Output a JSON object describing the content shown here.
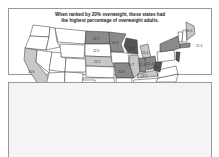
{
  "map": {
    "title_line1": "When ranked by 20% overweight, these states had",
    "title_line2": "the highest percentage of overweight adults.",
    "colors": {
      "dark": "#555555",
      "medium": "#8a8a8a",
      "light": "#c8c8c8",
      "none": "#ffffff",
      "border": "#333333"
    },
    "labels": [
      {
        "state": "ND",
        "value": "22.7"
      },
      {
        "state": "MN",
        "value": "21.9"
      },
      {
        "state": "SD",
        "value": "22.5"
      },
      {
        "state": "WI",
        "value": "22.6"
      },
      {
        "state": "NE",
        "value": "22.0"
      },
      {
        "state": "MO",
        "value": "22.8"
      },
      {
        "state": "MI",
        "value": "21.4"
      },
      {
        "state": "IL",
        "value": "20.7"
      },
      {
        "state": "IN",
        "value": "22.4"
      },
      {
        "state": "OH",
        "value": "21.4"
      },
      {
        "state": "KY",
        "value": "22.5"
      },
      {
        "state": "WV",
        "value": "23.4"
      },
      {
        "state": "CA",
        "value": "20.8"
      },
      {
        "state": "AL",
        "value": "22.6"
      },
      {
        "state": "SC",
        "value": "21.7"
      },
      {
        "state": "ME",
        "value": "20.3"
      },
      {
        "state": "MA",
        "value": "21.4"
      }
    ]
  }
}
